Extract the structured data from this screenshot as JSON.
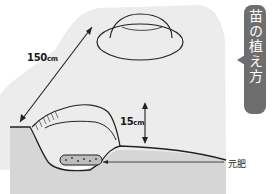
{
  "title": "苗の植え方",
  "labels": {
    "width_value": "150",
    "width_unit": "cm",
    "height_value": "15",
    "height_unit": "cm",
    "fertilizer": "元肥"
  },
  "colors": {
    "title_box": "#6e6e6e",
    "title_text": "#ffffff",
    "soil_surface": "#e9e9e9",
    "soil_section": "#d4d4d4",
    "outline": "#222222"
  }
}
